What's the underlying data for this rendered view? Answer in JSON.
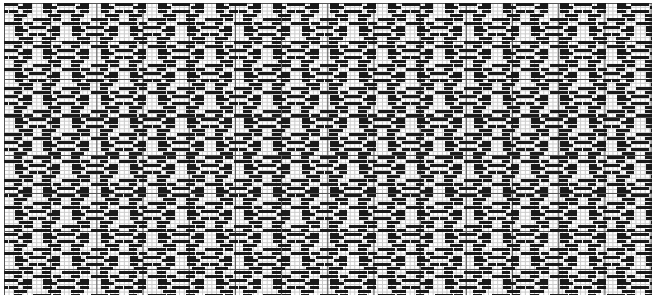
{
  "document": {
    "title": "Pattern Chart",
    "type": "grid-pattern-chart",
    "description": "Cross-stitch / weaving draft chart of repeating diamond rosette motifs on a squared grid"
  },
  "canvas": {
    "width": 661,
    "height": 300,
    "background_color": "#ffffff",
    "margin_left": 4,
    "margin_top": 3,
    "grid_width": 648,
    "grid_height": 292
  },
  "grid": {
    "cell_width": 4.62,
    "cell_height": 3.8,
    "columns": 140,
    "rows": 77,
    "minor_line_color": "#c9c9c9",
    "major_line_color": "#555555",
    "major_every": 10,
    "minor_line_width": 1,
    "major_line_width": 1
  },
  "pattern": {
    "fill_color": "#1a1a1a",
    "motif_name": "diamond-rosette",
    "repeat_x": 57.4,
    "repeat_y": 46.0,
    "stagger_x": 28.7,
    "stagger_y": 23.0,
    "columns_of_motifs": 13,
    "rows_of_motifs": 8,
    "motif_cells": [
      {
        "x": 4,
        "y": 0,
        "w": 4,
        "h": 1
      },
      {
        "x": 2,
        "y": 1,
        "w": 2,
        "h": 1
      },
      {
        "x": 6,
        "y": 1,
        "w": 2,
        "h": 1
      },
      {
        "x": 0,
        "y": 2,
        "w": 2,
        "h": 1
      },
      {
        "x": 3,
        "y": 2,
        "w": 4,
        "h": 1
      },
      {
        "x": 8,
        "y": 2,
        "w": 2,
        "h": 1
      },
      {
        "x": 0,
        "y": 3,
        "w": 3,
        "h": 1
      },
      {
        "x": 7,
        "y": 3,
        "w": 3,
        "h": 1
      },
      {
        "x": 0,
        "y": 4,
        "w": 2,
        "h": 1
      },
      {
        "x": 3,
        "y": 4,
        "w": 2,
        "h": 1
      },
      {
        "x": 5,
        "y": 4,
        "w": 2,
        "h": 1
      },
      {
        "x": 8,
        "y": 4,
        "w": 2,
        "h": 1
      },
      {
        "x": 1,
        "y": 5,
        "w": 3,
        "h": 1
      },
      {
        "x": 6,
        "y": 5,
        "w": 3,
        "h": 1
      },
      {
        "x": 2,
        "y": 6,
        "w": 2,
        "h": 1
      },
      {
        "x": 6,
        "y": 6,
        "w": 2,
        "h": 1
      },
      {
        "x": 4,
        "y": 7,
        "w": 4,
        "h": 1
      }
    ],
    "motif_cell_w": 10,
    "motif_cell_h": 8
  },
  "chart_data": {
    "type": "heatmap",
    "subtitle": "",
    "xlabel": "",
    "ylabel": "",
    "grid": true,
    "legend": "none",
    "xlim": [
      0,
      140
    ],
    "ylim": [
      0,
      77
    ],
    "categories": [],
    "values": []
  }
}
